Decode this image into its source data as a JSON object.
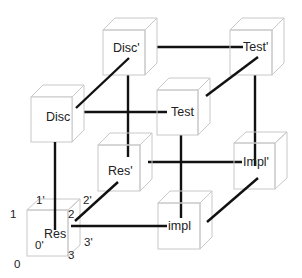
{
  "diagram": {
    "type": "cube-of-cubes",
    "nodes": [
      {
        "id": "disc_prime",
        "label": "Disc'",
        "front": [
          103,
          30,
          42,
          45
        ],
        "depth": [
          12,
          -12
        ]
      },
      {
        "id": "test_prime",
        "label": "Test'",
        "front": [
          230,
          30,
          42,
          45
        ],
        "depth": [
          12,
          -12
        ]
      },
      {
        "id": "disc",
        "label": "Disc",
        "front": [
          31,
          97,
          41,
          45
        ],
        "depth": [
          12,
          -12
        ]
      },
      {
        "id": "test",
        "label": "Test",
        "front": [
          157,
          90,
          41,
          45
        ],
        "depth": [
          12,
          -12
        ]
      },
      {
        "id": "res_prime",
        "label": "Res'",
        "front": [
          98,
          145,
          42,
          46
        ],
        "depth": [
          12,
          -12
        ]
      },
      {
        "id": "impl_prime",
        "label": "Impl'",
        "front": [
          234,
          143,
          41,
          46
        ],
        "depth": [
          12,
          -11
        ]
      },
      {
        "id": "impl",
        "label": "impl",
        "front": [
          158,
          203,
          42,
          46
        ],
        "depth": [
          12,
          -12
        ]
      },
      {
        "id": "res",
        "label": "Res",
        "front": [
          27,
          210,
          41,
          46
        ],
        "depth": [
          12,
          -11
        ]
      }
    ],
    "edges": [
      {
        "from": "disc_prime",
        "to": "test_prime"
      },
      {
        "from": "disc",
        "to": "disc_prime"
      },
      {
        "from": "disc",
        "to": "test"
      },
      {
        "from": "test",
        "to": "test_prime"
      },
      {
        "from": "disc_prime",
        "to": "res_prime"
      },
      {
        "from": "test_prime",
        "to": "impl_prime"
      },
      {
        "from": "disc",
        "to": "res"
      },
      {
        "from": "test",
        "to": "impl"
      },
      {
        "from": "res_prime",
        "to": "impl_prime"
      },
      {
        "from": "res",
        "to": "res_prime"
      },
      {
        "from": "res",
        "to": "impl"
      },
      {
        "from": "impl",
        "to": "impl_prime"
      }
    ],
    "corner_labels": [
      {
        "text": "1",
        "x": 10,
        "y": 218
      },
      {
        "text": "1'",
        "x": 36,
        "y": 204
      },
      {
        "text": "2'",
        "x": 83,
        "y": 204
      },
      {
        "text": "2",
        "x": 68,
        "y": 218
      },
      {
        "text": "0'",
        "x": 35,
        "y": 249
      },
      {
        "text": "3'",
        "x": 84,
        "y": 246
      },
      {
        "text": "0",
        "x": 14,
        "y": 268
      },
      {
        "text": "3",
        "x": 68,
        "y": 259
      }
    ]
  }
}
